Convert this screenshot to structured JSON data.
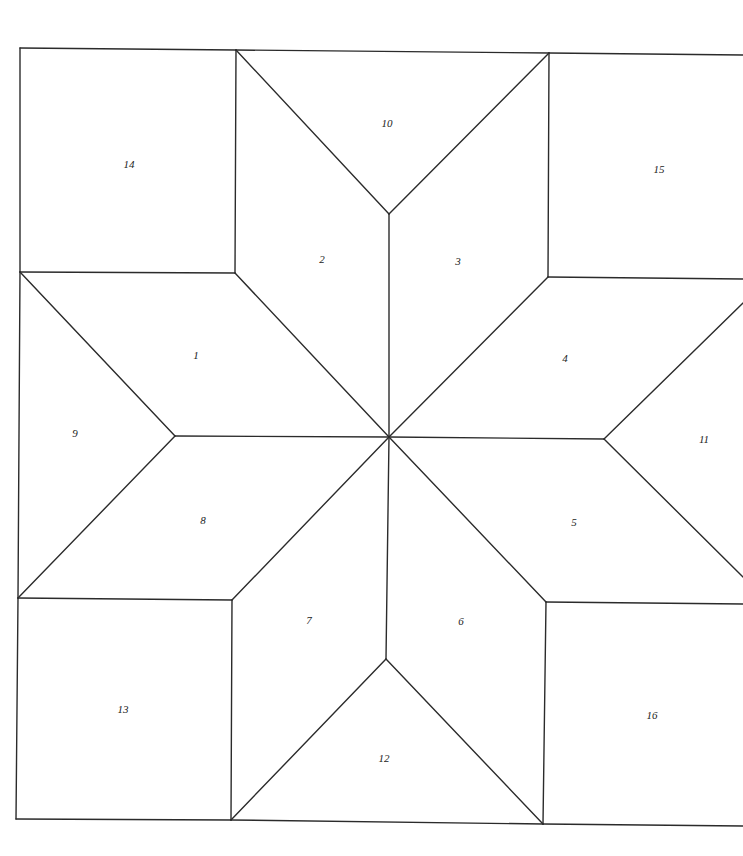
{
  "diagram": {
    "title": "",
    "stroke_color": "#2b2b2b",
    "background": "#ffffff",
    "pieces": [
      {
        "id": "1",
        "label": "1",
        "x": 196,
        "y": 356
      },
      {
        "id": "2",
        "label": "2",
        "x": 322,
        "y": 260
      },
      {
        "id": "3",
        "label": "3",
        "x": 458,
        "y": 262
      },
      {
        "id": "4",
        "label": "4",
        "x": 565,
        "y": 359
      },
      {
        "id": "5",
        "label": "5",
        "x": 574,
        "y": 523
      },
      {
        "id": "6",
        "label": "6",
        "x": 461,
        "y": 622
      },
      {
        "id": "7",
        "label": "7",
        "x": 309,
        "y": 621
      },
      {
        "id": "8",
        "label": "8",
        "x": 203,
        "y": 521
      },
      {
        "id": "9",
        "label": "9",
        "x": 75,
        "y": 434
      },
      {
        "id": "10",
        "label": "10",
        "x": 387,
        "y": 124
      },
      {
        "id": "11",
        "label": "11",
        "x": 704,
        "y": 440
      },
      {
        "id": "12",
        "label": "12",
        "x": 384,
        "y": 759
      },
      {
        "id": "13",
        "label": "13",
        "x": 123,
        "y": 710
      },
      {
        "id": "14",
        "label": "14",
        "x": 129,
        "y": 165
      },
      {
        "id": "15",
        "label": "15",
        "x": 659,
        "y": 170
      },
      {
        "id": "16",
        "label": "16",
        "x": 652,
        "y": 716
      }
    ],
    "edges": [
      [
        20,
        48,
        236,
        50
      ],
      [
        236,
        50,
        549,
        53
      ],
      [
        549,
        53,
        743,
        55
      ],
      [
        20,
        48,
        20,
        272
      ],
      [
        20,
        272,
        18,
        598
      ],
      [
        18,
        598,
        16,
        819
      ],
      [
        16,
        819,
        231,
        820
      ],
      [
        231,
        820,
        543,
        824
      ],
      [
        543,
        824,
        743,
        826
      ],
      [
        236,
        50,
        235,
        273
      ],
      [
        20,
        272,
        235,
        273
      ],
      [
        549,
        53,
        548,
        277
      ],
      [
        548,
        277,
        743,
        279
      ],
      [
        18,
        598,
        232,
        600
      ],
      [
        232,
        600,
        231,
        820
      ],
      [
        546,
        602,
        743,
        604
      ],
      [
        546,
        602,
        543,
        824
      ],
      [
        236,
        50,
        389,
        214
      ],
      [
        549,
        53,
        389,
        214
      ],
      [
        389,
        214,
        389,
        437
      ],
      [
        231,
        820,
        386,
        659
      ],
      [
        543,
        824,
        386,
        659
      ],
      [
        386,
        659,
        389,
        437
      ],
      [
        20,
        272,
        175,
        436
      ],
      [
        18,
        598,
        175,
        436
      ],
      [
        175,
        436,
        389,
        437
      ],
      [
        604,
        439,
        743,
        303
      ],
      [
        604,
        439,
        743,
        577
      ],
      [
        604,
        439,
        389,
        437
      ],
      [
        235,
        273,
        389,
        437
      ],
      [
        548,
        277,
        389,
        437
      ],
      [
        232,
        600,
        389,
        437
      ],
      [
        546,
        602,
        389,
        437
      ]
    ]
  }
}
